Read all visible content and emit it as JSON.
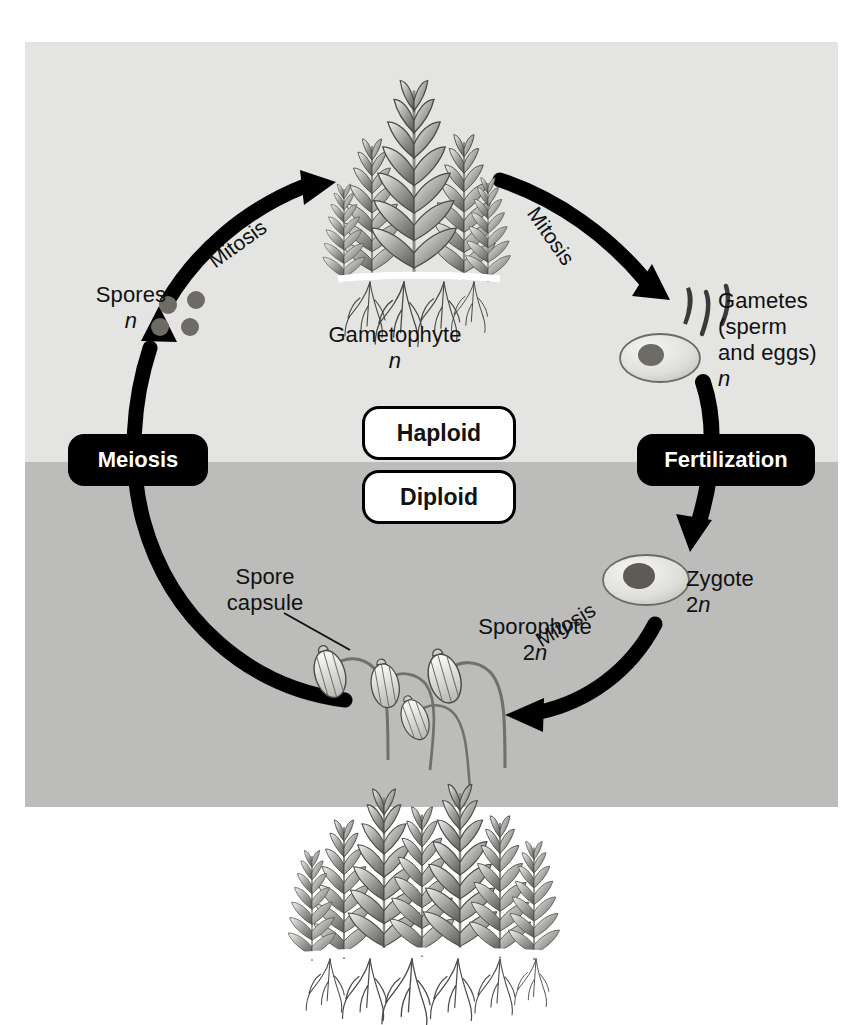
{
  "figure": {
    "colors": {
      "haploid_band": "#e4e4e2",
      "diploid_band": "#bcbcba",
      "arrow": "#000000",
      "badge_dark_bg": "#000000",
      "badge_dark_text": "#ffffff",
      "badge_light_bg": "#ffffff",
      "badge_light_text": "#111111",
      "spore_dot": "#6e6a66",
      "cell_fill": "#d8d8d4",
      "nucleus": "#6e6a66"
    }
  },
  "bands": {
    "haploid_label": "Haploid",
    "diploid_label": "Diploid"
  },
  "stages": {
    "spores": {
      "name": "Spores",
      "ploidy": "n",
      "count": 4
    },
    "gametophyte": {
      "name": "Gametophyte",
      "ploidy": "n"
    },
    "gametes": {
      "name": "Gametes",
      "detail": "(sperm",
      "detail2": "and eggs)",
      "ploidy": "n",
      "sperm_count": 3
    },
    "zygote": {
      "name": "Zygote",
      "ploidy": "2n"
    },
    "sporophyte": {
      "name": "Sporophyte",
      "ploidy": "2n"
    },
    "spore_capsule": {
      "line1": "Spore",
      "line2": "capsule"
    }
  },
  "processes": {
    "meiosis": "Meiosis",
    "fertilization": "Fertilization",
    "mitosis_spores_to_gametophyte": "Mitosis",
    "mitosis_gametophyte_to_gametes": "Mitosis",
    "mitosis_zygote_to_sporophyte": "Mitosis"
  },
  "icons": {
    "gametophyte": "moss-gametophyte-illustration",
    "sporophyte": "moss-sporophyte-illustration",
    "egg": "egg-cell-icon",
    "sperm": "sperm-cell-icon",
    "zygote": "zygote-cell-icon",
    "spore": "spore-dot-icon",
    "leader": "leader-line"
  }
}
